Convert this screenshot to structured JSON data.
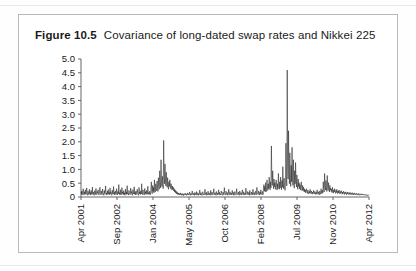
{
  "figure": {
    "number": "Figure 10.5",
    "caption": "Covariance of long-dated swap rates and Nikkei 225"
  },
  "chart_data": {
    "type": "line",
    "title": "Covariance of long-dated swap rates and Nikkei 225",
    "xlabel": "",
    "ylabel": "",
    "grid": false,
    "legend": "none",
    "ylim": [
      0,
      5.0
    ],
    "ytick_labels": [
      "5.0",
      "4.5",
      "4.0",
      "3.5",
      "3.0",
      "2.5",
      "2.0",
      "1.5",
      "1.0",
      "0.5",
      "0"
    ],
    "ytick_values": [
      5.0,
      4.5,
      4.0,
      3.5,
      3.0,
      2.5,
      2.0,
      1.5,
      1.0,
      0.5,
      0
    ],
    "xtick_labels": [
      "Apr 2001",
      "Sep 2002",
      "Jan 2004",
      "May 2005",
      "Oct 2006",
      "Feb 2008",
      "Jul 2009",
      "Nov 2010",
      "Apr 2012"
    ],
    "xtick_positions": [
      0,
      0.125,
      0.25,
      0.375,
      0.5,
      0.625,
      0.75,
      0.875,
      1.0
    ],
    "series": [
      {
        "name": "Covariance",
        "color": "#1c1c1c",
        "values": [
          0.18,
          0.1,
          0.22,
          0.08,
          0.14,
          0.3,
          0.12,
          0.07,
          0.19,
          0.11,
          0.26,
          0.09,
          0.15,
          0.33,
          0.1,
          0.06,
          0.21,
          0.13,
          0.08,
          0.28,
          0.12,
          0.17,
          0.07,
          0.24,
          0.1,
          0.14,
          0.36,
          0.09,
          0.18,
          0.11,
          0.06,
          0.23,
          0.15,
          0.09,
          0.31,
          0.12,
          0.08,
          0.2,
          0.14,
          0.26,
          0.1,
          0.07,
          0.17,
          0.35,
          0.11,
          0.09,
          0.22,
          0.13,
          0.08,
          0.29,
          0.16,
          0.1,
          0.06,
          0.24,
          0.12,
          0.18,
          0.4,
          0.09,
          0.14,
          0.07,
          0.21,
          0.11,
          0.27,
          0.1,
          0.16,
          0.08,
          0.33,
          0.12,
          0.19,
          0.09,
          0.06,
          0.25,
          0.14,
          0.1,
          0.38,
          0.11,
          0.17,
          0.07,
          0.22,
          0.13,
          0.09,
          0.3,
          0.15,
          0.08,
          0.2,
          0.12,
          0.45,
          0.1,
          0.16,
          0.07,
          0.26,
          0.11,
          0.09,
          0.34,
          0.13,
          0.18,
          0.08,
          0.23,
          0.1,
          0.15,
          0.06,
          0.29,
          0.12,
          0.19,
          0.09,
          0.41,
          0.11,
          0.14,
          0.07,
          0.24,
          0.16,
          0.1,
          0.08,
          0.32,
          0.13,
          0.2,
          0.09,
          0.06,
          0.27,
          0.15,
          0.11,
          0.37,
          0.1,
          0.17,
          0.08,
          0.22,
          0.12,
          0.09,
          0.28,
          0.14,
          0.1,
          0.06,
          0.35,
          0.12,
          0.18,
          0.09,
          0.23,
          0.11,
          0.48,
          0.13,
          0.08,
          0.26,
          0.15,
          0.1,
          0.07,
          0.31,
          0.12,
          0.19,
          0.09,
          0.24,
          0.14,
          0.1,
          0.39,
          0.11,
          0.16,
          0.08,
          0.21,
          0.13,
          0.09,
          0.29,
          0.55,
          0.18,
          0.12,
          0.42,
          0.2,
          0.35,
          0.15,
          0.62,
          0.25,
          0.18,
          0.48,
          0.3,
          0.22,
          0.58,
          0.35,
          0.2,
          0.7,
          0.4,
          0.28,
          0.95,
          0.52,
          0.33,
          1.35,
          0.6,
          0.38,
          0.75,
          0.45,
          0.3,
          2.05,
          0.85,
          0.48,
          1.2,
          0.65,
          0.4,
          0.9,
          0.52,
          0.35,
          0.7,
          0.44,
          0.28,
          0.55,
          0.38,
          0.62,
          0.42,
          0.3,
          0.48,
          0.33,
          0.25,
          0.4,
          0.28,
          0.35,
          0.22,
          0.3,
          0.18,
          0.26,
          0.15,
          0.22,
          0.12,
          0.19,
          0.1,
          0.16,
          0.09,
          0.14,
          0.08,
          0.12,
          0.07,
          0.15,
          0.09,
          0.11,
          0.06,
          0.13,
          0.08,
          0.1,
          0.05,
          0.12,
          0.07,
          0.09,
          0.14,
          0.08,
          0.11,
          0.06,
          0.1,
          0.15,
          0.08,
          0.12,
          0.07,
          0.09,
          0.18,
          0.1,
          0.06,
          0.13,
          0.08,
          0.11,
          0.22,
          0.09,
          0.07,
          0.14,
          0.1,
          0.06,
          0.17,
          0.09,
          0.12,
          0.07,
          0.2,
          0.1,
          0.08,
          0.15,
          0.06,
          0.11,
          0.09,
          0.25,
          0.12,
          0.07,
          0.16,
          0.09,
          0.06,
          0.13,
          0.19,
          0.08,
          0.11,
          0.07,
          0.14,
          0.28,
          0.1,
          0.08,
          0.17,
          0.06,
          0.12,
          0.09,
          0.21,
          0.11,
          0.07,
          0.15,
          0.09,
          0.06,
          0.24,
          0.12,
          0.08,
          0.18,
          0.1,
          0.07,
          0.13,
          0.3,
          0.11,
          0.08,
          0.16,
          0.09,
          0.06,
          0.2,
          0.12,
          0.07,
          0.14,
          0.1,
          0.26,
          0.09,
          0.17,
          0.07,
          0.11,
          0.08,
          0.22,
          0.13,
          0.09,
          0.06,
          0.18,
          0.11,
          0.08,
          0.34,
          0.15,
          0.1,
          0.07,
          0.21,
          0.12,
          0.09,
          0.16,
          0.06,
          0.13,
          0.28,
          0.1,
          0.08,
          0.19,
          0.11,
          0.07,
          0.14,
          0.09,
          0.24,
          0.12,
          0.08,
          0.17,
          0.06,
          0.1,
          0.2,
          0.13,
          0.09,
          0.07,
          0.3,
          0.15,
          0.11,
          0.08,
          0.18,
          0.1,
          0.06,
          0.22,
          0.13,
          0.09,
          0.16,
          0.07,
          0.11,
          0.26,
          0.12,
          0.08,
          0.19,
          0.1,
          0.07,
          0.14,
          0.09,
          0.32,
          0.15,
          0.11,
          0.08,
          0.2,
          0.12,
          0.09,
          0.17,
          0.06,
          0.24,
          0.13,
          0.1,
          0.07,
          0.18,
          0.11,
          0.08,
          0.28,
          0.14,
          0.09,
          0.16,
          0.07,
          0.12,
          0.21,
          0.1,
          0.08,
          0.35,
          0.16,
          0.11,
          0.09,
          0.22,
          0.13,
          0.07,
          0.18,
          0.1,
          0.26,
          0.14,
          0.09,
          0.12,
          0.2,
          0.08,
          0.3,
          0.45,
          0.22,
          0.38,
          0.18,
          0.52,
          0.28,
          0.2,
          0.62,
          0.35,
          0.24,
          0.48,
          0.3,
          0.72,
          0.4,
          0.26,
          0.55,
          0.33,
          1.85,
          0.7,
          0.42,
          0.95,
          0.5,
          0.3,
          0.65,
          0.38,
          0.52,
          0.28,
          0.44,
          0.62,
          0.35,
          0.25,
          0.48,
          0.3,
          0.85,
          0.4,
          0.28,
          0.55,
          0.33,
          0.72,
          0.42,
          0.26,
          0.6,
          0.35,
          1.1,
          0.5,
          0.3,
          0.68,
          0.38,
          0.24,
          0.45,
          1.95,
          0.75,
          0.4,
          4.6,
          1.25,
          0.65,
          2.4,
          0.9,
          0.48,
          1.6,
          0.7,
          0.38,
          1.15,
          0.55,
          1.8,
          0.72,
          0.42,
          1.35,
          0.58,
          0.32,
          0.95,
          0.48,
          1.25,
          0.62,
          0.36,
          0.8,
          0.44,
          0.28,
          0.65,
          0.38,
          0.52,
          0.3,
          0.45,
          0.25,
          0.38,
          0.55,
          0.3,
          0.22,
          0.42,
          0.26,
          0.35,
          0.2,
          0.3,
          0.18,
          0.26,
          0.15,
          0.22,
          0.3,
          0.17,
          0.13,
          0.25,
          0.16,
          0.11,
          0.2,
          0.14,
          0.28,
          0.18,
          0.12,
          0.22,
          0.15,
          0.1,
          0.18,
          0.13,
          0.24,
          0.16,
          0.11,
          0.2,
          0.14,
          0.09,
          0.17,
          0.12,
          0.26,
          0.15,
          0.1,
          0.19,
          0.13,
          0.08,
          0.22,
          0.14,
          0.1,
          0.3,
          0.18,
          0.12,
          0.24,
          0.15,
          0.55,
          0.28,
          0.18,
          0.85,
          0.4,
          0.25,
          0.6,
          0.33,
          0.2,
          0.78,
          0.38,
          0.24,
          0.52,
          0.3,
          0.18,
          0.42,
          0.25,
          0.32,
          0.2,
          0.28,
          0.16,
          0.35,
          0.22,
          0.14,
          0.26,
          0.18,
          0.3,
          0.2,
          0.13,
          0.24,
          0.16,
          0.28,
          0.18,
          0.12,
          0.22,
          0.15,
          0.25,
          0.17,
          0.11,
          0.2,
          0.14,
          0.23,
          0.16,
          0.1,
          0.18,
          0.13,
          0.21,
          0.15,
          0.09,
          0.17,
          0.12,
          0.19,
          0.14,
          0.08,
          0.16,
          0.11,
          0.18,
          0.13,
          0.09,
          0.15,
          0.1,
          0.17,
          0.12,
          0.08,
          0.14,
          0.1,
          0.16,
          0.11,
          0.07,
          0.13,
          0.09,
          0.15,
          0.1,
          0.08,
          0.12,
          0.09,
          0.14,
          0.1,
          0.07,
          0.11,
          0.08,
          0.13,
          0.09,
          0.06,
          0.1,
          0.08,
          0.12,
          0.09,
          0.07,
          0.11,
          0.08,
          0.1,
          0.07,
          0.09,
          0.06,
          0.08,
          0.07,
          0.09,
          0.06,
          0.08,
          0.05,
          0.07,
          0.06,
          0.08,
          0.05
        ]
      }
    ]
  }
}
